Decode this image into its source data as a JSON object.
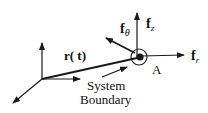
{
  "diagram": {
    "type": "force-vector-diagram",
    "colors": {
      "stroke": "#1a1a1a",
      "background": "#ffffff"
    },
    "labels": {
      "position_vector": "r( t)",
      "point": "A",
      "force_z": {
        "base": "f",
        "sub": "z"
      },
      "force_theta": {
        "base": "f",
        "sub": "θ"
      },
      "force_r": {
        "base": "f",
        "sub": "r"
      },
      "boundary_line1": "System",
      "boundary_line2": "Boundary"
    },
    "nodes": [
      {
        "id": "origin",
        "label": ""
      },
      {
        "id": "point-A",
        "label": "A"
      }
    ],
    "edges": [
      {
        "from": "origin",
        "to": "point-A",
        "label": "r( t)"
      }
    ]
  }
}
